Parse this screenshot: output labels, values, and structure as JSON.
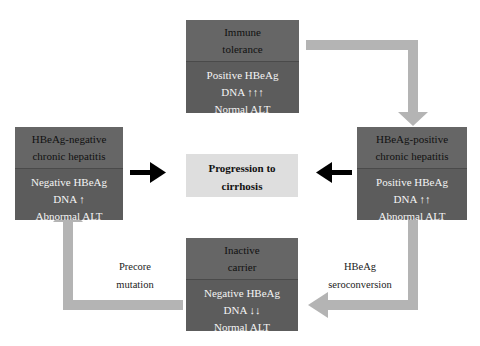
{
  "diagram": {
    "nodes": {
      "immune_tolerance": {
        "title_line1": "Immune",
        "title_line2": "tolerance",
        "line1": "Positive HBeAg",
        "line2": "DNA ↑↑↑",
        "line3": "Normal ALT"
      },
      "hbeag_negative": {
        "title_line1": "HBeAg-negative",
        "title_line2": "chronic hepatitis",
        "line1": "Negative HBeAg",
        "line2": "DNA ↑",
        "line3": "Abnormal ALT"
      },
      "hbeag_positive": {
        "title_line1": "HBeAg-positive",
        "title_line2": "chronic hepatitis",
        "line1": "Positive HBeAg",
        "line2": "DNA ↑↑",
        "line3": "Abnormal ALT"
      },
      "inactive_carrier": {
        "title_line1": "Inactive",
        "title_line2": "carrier",
        "line1": "Negative HBeAg",
        "line2": "DNA ↓↓",
        "line3": "Normal ALT"
      },
      "cirrhosis": {
        "line1": "Progression to",
        "line2": "cirrhosis"
      }
    },
    "edge_labels": {
      "precore_line1": "Precore",
      "precore_line2": "mutation",
      "sero_line1": "HBeAg",
      "sero_line2": "seroconversion"
    },
    "colors": {
      "box_fill": "#5c5c5c",
      "center_fill": "#dedede",
      "gray_arrow": "#b4b4b4",
      "black_arrow": "#000000"
    }
  }
}
